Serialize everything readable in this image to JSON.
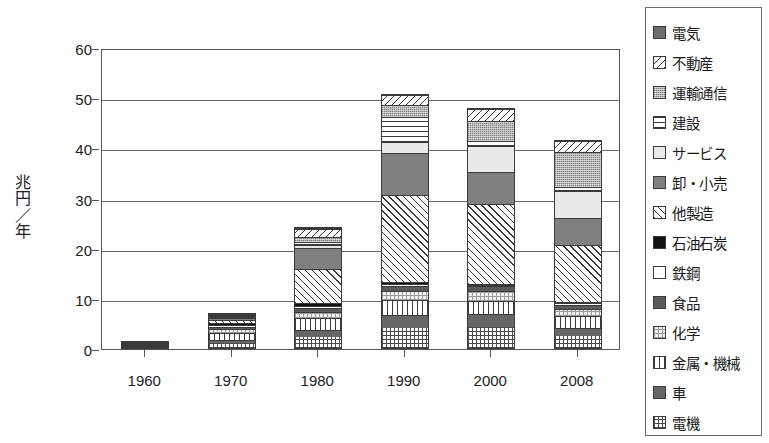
{
  "chart_data": {
    "type": "bar",
    "stacked": true,
    "title": "",
    "subtitle": "",
    "xlabel": "",
    "ylabel": "兆円／年",
    "ylabel_chars": [
      "兆",
      "円",
      "／",
      "年"
    ],
    "categories": [
      "1960",
      "1970",
      "1980",
      "1990",
      "2000",
      "2008"
    ],
    "ylim": [
      0,
      60
    ],
    "yticks": [
      0,
      10,
      20,
      30,
      40,
      50,
      60
    ],
    "ytick_labels": [
      "0",
      "10",
      "20",
      "30",
      "40",
      "50",
      "60"
    ],
    "grid": true,
    "legend_position": "right",
    "series": [
      {
        "name": "電機",
        "pattern": "crosshatch-grid",
        "values": [
          0.35,
          1.2,
          2.2,
          4.0,
          4.3,
          2.4
        ]
      },
      {
        "name": "車",
        "pattern": "solid-dark-gray",
        "values": [
          0.15,
          0.6,
          1.5,
          2.6,
          2.6,
          1.6
        ]
      },
      {
        "name": "金属・機械",
        "pattern": "vertical-lines",
        "values": [
          0.45,
          1.5,
          2.3,
          3.0,
          2.6,
          2.4
        ]
      },
      {
        "name": "化学",
        "pattern": "light-checker",
        "values": [
          0.25,
          0.9,
          1.4,
          1.8,
          1.9,
          1.5
        ]
      },
      {
        "name": "食品",
        "pattern": "solid-mid-dark",
        "values": [
          0.1,
          0.4,
          0.7,
          1.1,
          1.0,
          0.8
        ]
      },
      {
        "name": "鉄鋼",
        "pattern": "white",
        "values": [
          0.1,
          0.5,
          0.5,
          0.4,
          0.3,
          0.3
        ]
      },
      {
        "name": "石油石炭",
        "pattern": "black",
        "values": [
          0.05,
          0.3,
          0.5,
          0.3,
          0.2,
          0.2
        ]
      },
      {
        "name": "他製造",
        "pattern": "diagonal-forward",
        "values": [
          0.1,
          0.8,
          7.0,
          17.6,
          16.0,
          11.6
        ]
      },
      {
        "name": "卸・小売",
        "pattern": "solid-gray",
        "values": [
          0.0,
          0.3,
          4.2,
          8.4,
          6.4,
          5.3
        ]
      },
      {
        "name": "サービス",
        "pattern": "very-light",
        "values": [
          0.0,
          0.2,
          0.6,
          2.2,
          5.3,
          5.4
        ]
      },
      {
        "name": "建設",
        "pattern": "horizontal-lines",
        "values": [
          0.0,
          0.1,
          0.5,
          5.0,
          1.1,
          0.9
        ]
      },
      {
        "name": "運輸通信",
        "pattern": "dotted-gray",
        "values": [
          0.0,
          0.2,
          1.2,
          2.4,
          4.0,
          7.0
        ]
      },
      {
        "name": "不動産",
        "pattern": "diagonal-back",
        "values": [
          0.0,
          0.1,
          1.5,
          2.0,
          2.3,
          2.3
        ]
      },
      {
        "name": "電気",
        "pattern": "solid-dark",
        "values": [
          0.0,
          0.0,
          0.3,
          0.0,
          0.0,
          0.0
        ]
      }
    ],
    "totals": [
      1.55,
      7.1,
      24.4,
      50.8,
      48.0,
      41.7
    ]
  },
  "legend": {
    "items": [
      {
        "label": "電気",
        "swatch": "p-denki"
      },
      {
        "label": "不動産",
        "swatch": "p-fudosan"
      },
      {
        "label": "運輸通信",
        "swatch": "p-unyu"
      },
      {
        "label": "建設",
        "swatch": "p-kensetsu"
      },
      {
        "label": "サービス",
        "swatch": "p-service"
      },
      {
        "label": "卸・小売",
        "swatch": "p-oroshi"
      },
      {
        "label": "他製造",
        "swatch": "p-taseizo"
      },
      {
        "label": "石油石炭",
        "swatch": "p-sekiyu"
      },
      {
        "label": "鉄鋼",
        "swatch": "p-tekko"
      },
      {
        "label": "食品",
        "swatch": "p-shokuhin"
      },
      {
        "label": "化学",
        "swatch": "p-kagaku"
      },
      {
        "label": "金属・機械",
        "swatch": "p-kinzoku"
      },
      {
        "label": "車",
        "swatch": "p-kuruma"
      },
      {
        "label": "電機",
        "swatch": "p-denki2"
      }
    ]
  },
  "style": {
    "axis_color": "#555555",
    "grid_color": "#6b6b6b",
    "text_color": "#1a1a1a",
    "background": "#ffffff"
  }
}
